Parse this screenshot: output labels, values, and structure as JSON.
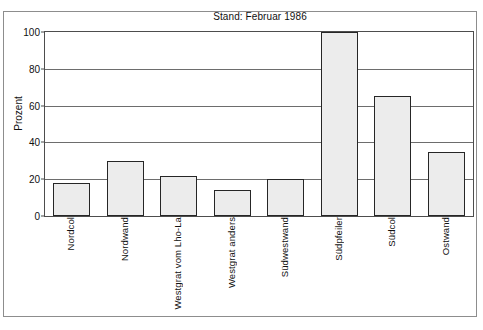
{
  "chart_data": {
    "type": "bar",
    "title": "Stand: Februar 1986",
    "xlabel": "",
    "ylabel": "Prozent",
    "ylim": [
      0,
      100
    ],
    "yticks": [
      0,
      20,
      40,
      60,
      80,
      100
    ],
    "ytick_labels": [
      "0",
      "20",
      "40",
      "60",
      "80",
      "100"
    ],
    "grid": true,
    "legend": false,
    "bar_fill_color": "#ececec",
    "bar_edge_color": "#262626",
    "categories": [
      "Nordcol",
      "Nordwand",
      "Westgrat vom Lho-La",
      "Westgrat anders",
      "Südwestwand",
      "Südpfeiler",
      "Südcol",
      "Ostwand"
    ],
    "values": [
      18,
      30,
      22,
      14,
      20,
      100,
      65,
      35
    ]
  }
}
